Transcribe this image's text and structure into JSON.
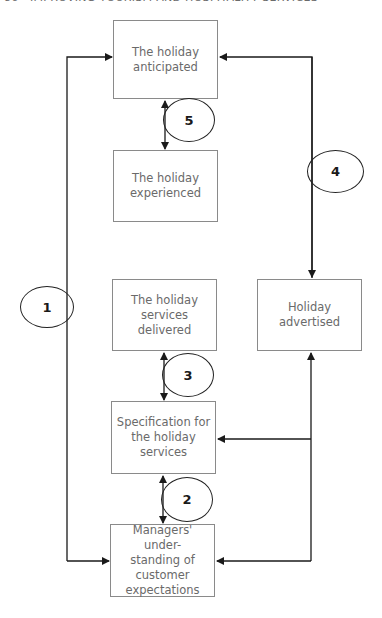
{
  "header": {
    "text": "86 · IMPROVING TOURISM AND HOSPITALITY SERVICES"
  },
  "boxes": {
    "anticipated": "The holiday\nanticipated",
    "experienced": "The holiday\nexperienced",
    "delivered": "The holiday\nservices delivered",
    "advertised": "Holiday\nadvertised",
    "specification": "Specification for\nthe holiday\nservices",
    "managers": "Managers' under-\nstanding of customer\nexpectations"
  },
  "gaps": [
    "1",
    "2",
    "3",
    "4",
    "5"
  ],
  "colors": {
    "line": "#1a1a1a",
    "box_border": "#8a8a8a",
    "box_text": "#6a6a6a"
  }
}
